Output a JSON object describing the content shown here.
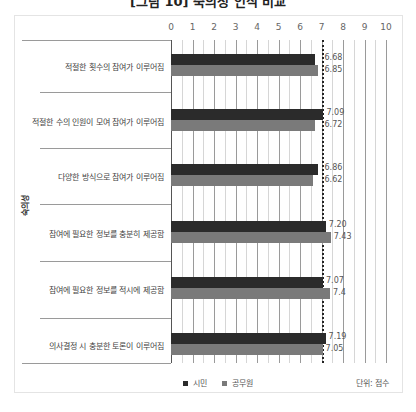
{
  "title": "[그림 10] 숙의성 인식 비교",
  "colors": {
    "series_a": "#2b2b2b",
    "series_b": "#7a7a7a",
    "reference_line": "#222222"
  },
  "legend": {
    "series_a": "시민",
    "series_b": "공무원"
  },
  "unit": "단위: 점수",
  "group_label": "숙의성",
  "axis_ticks": [
    "0",
    "1",
    "2",
    "3",
    "4",
    "5",
    "6",
    "7",
    "8",
    "9",
    "10"
  ],
  "rows": [
    {
      "label": "적절한 횟수의 참여가 이루어짐",
      "a": "6.68",
      "b": "6.85"
    },
    {
      "label": "적절한 수의 인원이 모여 참여가 이루어짐",
      "a": "7.09",
      "b": "6.72"
    },
    {
      "label": "다양한 방식으로 참여가 이루어짐",
      "a": "6.86",
      "b": "6.62"
    },
    {
      "label": "참여에 필요한 정보를 충분히 제공함",
      "a": "7.20",
      "b": "7.43"
    },
    {
      "label": "참여에 필요한 정보를 적시에 제공함",
      "a": "7.07",
      "b": "7.4"
    },
    {
      "label": "의사결정 시 충분한 토론이 이루어짐",
      "a": "7.19",
      "b": "7.05"
    }
  ],
  "chart_data": {
    "type": "bar",
    "orientation": "horizontal",
    "title": "[그림 10] 숙의성 인식 비교",
    "categories": [
      "적절한 횟수의 참여가 이루어짐",
      "적절한 수의 인원이 모여 참여가 이루어짐",
      "다양한 방식으로 참여가 이루어짐",
      "참여에 필요한 정보를 충분히 제공함",
      "참여에 필요한 정보를 적시에 제공함",
      "의사결정 시 충분한 토론이 이루어짐"
    ],
    "series": [
      {
        "name": "시민",
        "values": [
          6.68,
          7.09,
          6.86,
          7.2,
          7.07,
          7.19
        ]
      },
      {
        "name": "공무원",
        "values": [
          6.85,
          6.72,
          6.62,
          7.43,
          7.4,
          7.05
        ]
      }
    ],
    "group_label": "숙의성",
    "xlabel": "",
    "ylabel": "숙의성",
    "xlim": [
      0,
      10
    ],
    "x_ticks": [
      0,
      1,
      2,
      3,
      4,
      5,
      6,
      7,
      8,
      9,
      10
    ],
    "reference_line": 7,
    "grid": true,
    "legend_position": "bottom",
    "unit": "단위: 점수"
  }
}
